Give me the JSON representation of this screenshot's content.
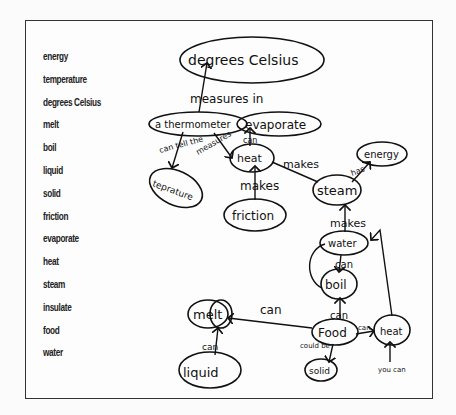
{
  "word_list": [
    "energy",
    "temperature",
    "degrees Celsius",
    "melt",
    "boil",
    "liquid",
    "solid",
    "friction",
    "evaporate",
    "heat",
    "steam",
    "insulate",
    "food",
    "water"
  ],
  "concept_map": {
    "nodes": {
      "degrees_celsius": "degrees Celsius",
      "thermometer": "a thermometer",
      "evaporate": "evaporate",
      "temperature": "teprature",
      "heat_top": "heat",
      "friction": "friction",
      "steam": "steam",
      "energy": "energy",
      "water": "water",
      "boil": "boil",
      "melt": "melt",
      "liquid": "liquid",
      "food": "Food",
      "heat_bottom": "heat",
      "solid": "solid"
    },
    "edges": {
      "measures_in": "measures in",
      "can_tell_the": "can tell the",
      "measures": "measures",
      "can_evaporate": "can",
      "heat_makes_steam": "makes",
      "friction_makes_heat": "makes",
      "steam_has_energy": "has",
      "water_makes_steam": "makes",
      "water_can_boil": "can",
      "food_can_boil": "can",
      "food_can_melt": "can",
      "liquid_can_melt": "can",
      "food_could_be_solid": "could be",
      "food_can_heat": "can",
      "you_can_heat": "you can"
    }
  }
}
